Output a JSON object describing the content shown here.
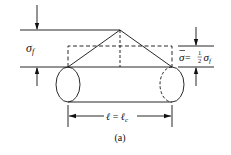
{
  "figure": {
    "caption": "(a)",
    "labels": {
      "sigma_f_symbol": "σ",
      "sigma_f_sub": "f",
      "avg_stress_symbol": "σ",
      "avg_stress_eq": " = ",
      "avg_stress_num": "1",
      "avg_stress_den": "2",
      "avg_stress_sigma": "σ",
      "avg_stress_sub": "f",
      "length_l": "ℓ",
      "length_eq": " = ",
      "length_lc": "ℓ",
      "length_lc_sub": "c"
    }
  }
}
